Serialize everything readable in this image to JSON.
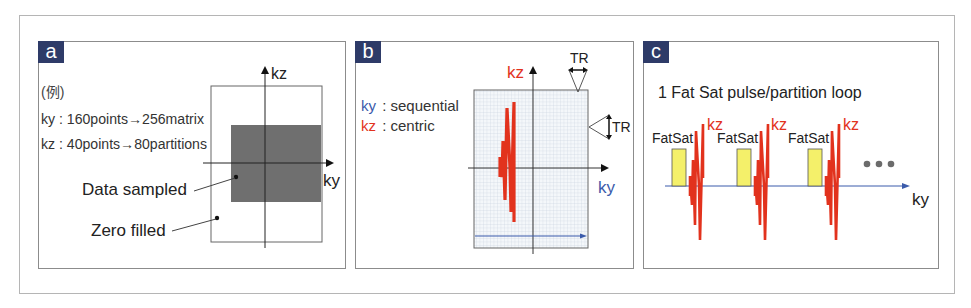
{
  "colors": {
    "label_bg": "#2e3b68",
    "kz_red": "#e2321d",
    "ky_blue": "#3b5bab",
    "sampled_gray": "#6f6f6f",
    "fatsat_yellow": "#f4f06a",
    "grid_line": "#c9d3dd",
    "dots_gray": "#6b6b6b"
  },
  "panel_a": {
    "label": "a",
    "example": "(例)",
    "line_ky": "ky : 160points→256matrix",
    "line_kz": "kz : 40points→80partitions",
    "axis_kz": "kz",
    "axis_ky": "ky",
    "data_sampled": "Data sampled",
    "zero_filled": "Zero filled"
  },
  "panel_b": {
    "label": "b",
    "legend_ky_key": "ky",
    "legend_ky_value": ": sequential",
    "legend_kz_key": "kz",
    "legend_kz_value": ": centric",
    "axis_kz": "kz",
    "axis_ky": "ky",
    "tr_top": "TR",
    "tr_right": "TR"
  },
  "panel_c": {
    "label": "c",
    "title": "1 Fat Sat pulse/partition loop",
    "fatsat_labels": [
      "FatSat",
      "FatSat",
      "FatSat"
    ],
    "kz_labels": [
      "kz",
      "kz",
      "kz"
    ],
    "ellipsis": "•••",
    "axis_ky": "ky"
  }
}
